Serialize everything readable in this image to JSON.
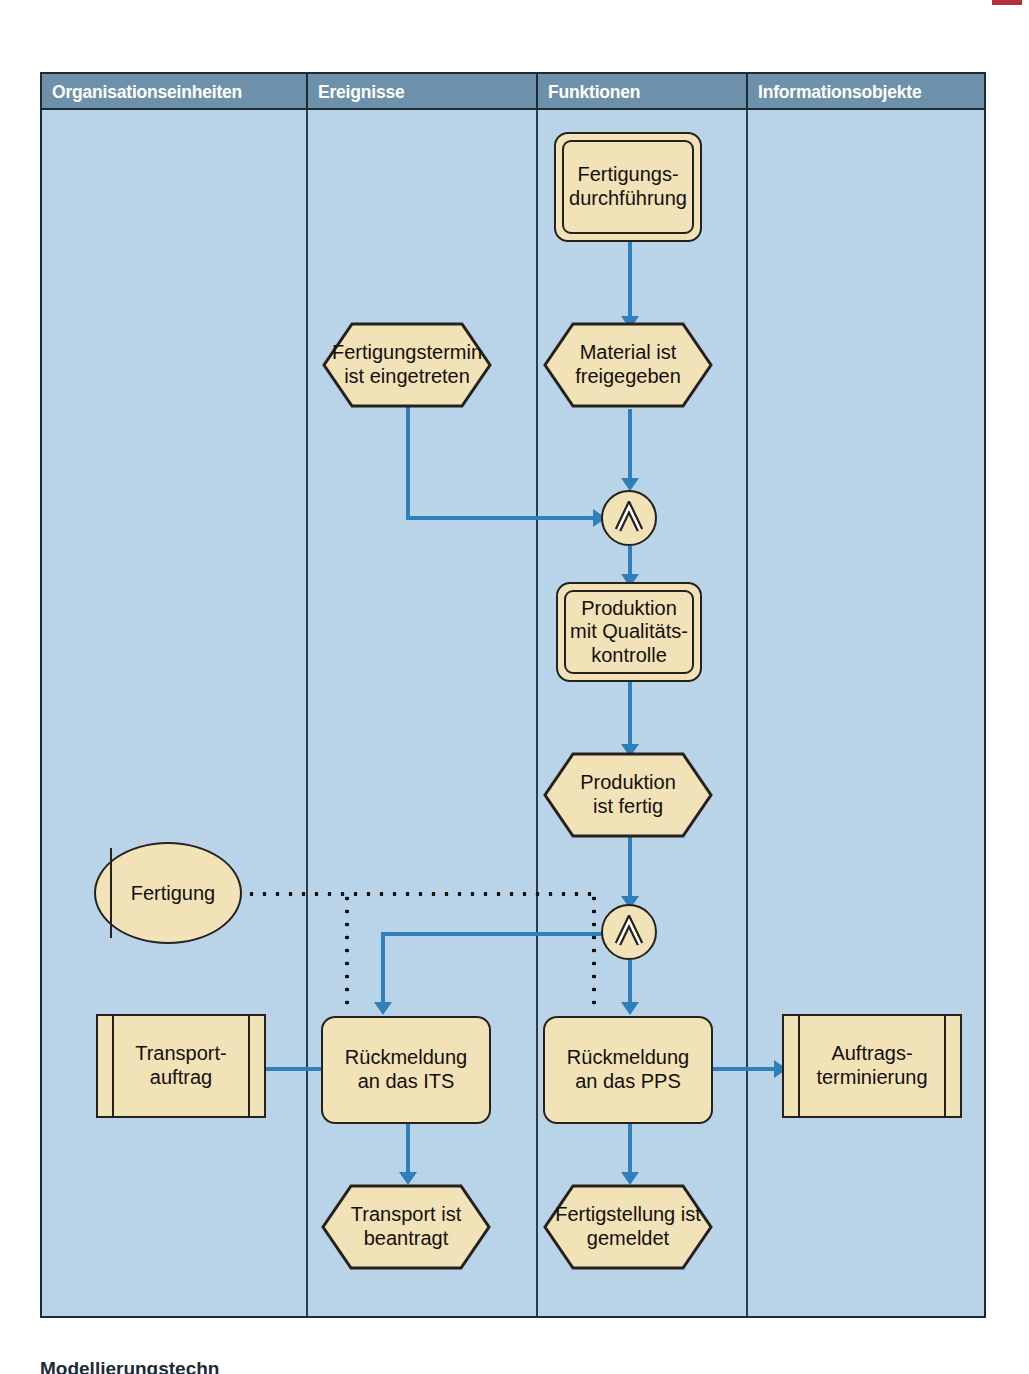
{
  "diagram": {
    "type": "epc-event-driven-process-chain",
    "columns": [
      {
        "id": "org",
        "label": "Organisationseinheiten"
      },
      {
        "id": "event",
        "label": "Ereignisse"
      },
      {
        "id": "func",
        "label": "Funktionen"
      },
      {
        "id": "info",
        "label": "Informationsobjekte"
      }
    ],
    "colors": {
      "background": "#b9d3e8",
      "header_bar": "#6e91ab",
      "header_text": "#ffffff",
      "shape_fill": "#f2e2b8",
      "shape_border": "#26211c",
      "control_flow": "#2e7fba",
      "assignment_flow": "#16130f",
      "frame_border": "#1c2a33"
    },
    "nodes": {
      "fertigungsdurchfuehrung": {
        "kind": "function",
        "column": "func",
        "label": "Fertigungs-\ndurchführung"
      },
      "fertigungstermin": {
        "kind": "event",
        "column": "event",
        "label": "Fertigungstermin\nist eingetreten"
      },
      "material_freigegeben": {
        "kind": "event",
        "column": "func",
        "label": "Material ist\nfreigegeben"
      },
      "and_1": {
        "kind": "connector",
        "column": "func",
        "label": "∧",
        "operator": "AND"
      },
      "produktion_qk": {
        "kind": "function",
        "column": "func",
        "label": "Produktion\nmit Qualitäts-\nkontrolle"
      },
      "produktion_fertig": {
        "kind": "event",
        "column": "func",
        "label": "Produktion\nist fertig"
      },
      "and_2": {
        "kind": "connector",
        "column": "func",
        "label": "∧",
        "operator": "AND"
      },
      "fertigung": {
        "kind": "org-unit",
        "column": "org",
        "label": "Fertigung"
      },
      "transportauftrag": {
        "kind": "info-object",
        "column": "org",
        "label": "Transport-\nauftrag"
      },
      "rueckmeldung_its": {
        "kind": "function",
        "column": "event",
        "label": "Rückmeldung\nan das ITS"
      },
      "rueckmeldung_pps": {
        "kind": "function",
        "column": "func",
        "label": "Rückmeldung\nan das PPS"
      },
      "auftragsterminierung": {
        "kind": "info-object",
        "column": "info",
        "label": "Auftrags-\nterminierung"
      },
      "transport_beantragt": {
        "kind": "event",
        "column": "event",
        "label": "Transport ist\nbeantragt"
      },
      "fertigstellung_gemeldet": {
        "kind": "event",
        "column": "func",
        "label": "Fertigstellung ist\ngemeldet"
      }
    },
    "edges": [
      {
        "from": "fertigungsdurchfuehrung",
        "to": "material_freigegeben",
        "style": "control-flow"
      },
      {
        "from": "fertigungstermin",
        "to": "and_1",
        "style": "control-flow"
      },
      {
        "from": "material_freigegeben",
        "to": "and_1",
        "style": "control-flow"
      },
      {
        "from": "and_1",
        "to": "produktion_qk",
        "style": "control-flow"
      },
      {
        "from": "produktion_qk",
        "to": "produktion_fertig",
        "style": "control-flow"
      },
      {
        "from": "produktion_fertig",
        "to": "and_2",
        "style": "control-flow"
      },
      {
        "from": "and_2",
        "to": "rueckmeldung_its",
        "style": "control-flow"
      },
      {
        "from": "and_2",
        "to": "rueckmeldung_pps",
        "style": "control-flow"
      },
      {
        "from": "fertigung",
        "to": "rueckmeldung_its",
        "style": "assignment-dotted"
      },
      {
        "from": "fertigung",
        "to": "rueckmeldung_pps",
        "style": "assignment-dotted"
      },
      {
        "from": "rueckmeldung_its",
        "to": "transportauftrag",
        "style": "control-flow"
      },
      {
        "from": "rueckmeldung_pps",
        "to": "auftragsterminierung",
        "style": "control-flow"
      },
      {
        "from": "rueckmeldung_its",
        "to": "transport_beantragt",
        "style": "control-flow"
      },
      {
        "from": "rueckmeldung_pps",
        "to": "fertigstellung_gemeldet",
        "style": "control-flow"
      }
    ]
  },
  "caption": "Modellierungstechn"
}
